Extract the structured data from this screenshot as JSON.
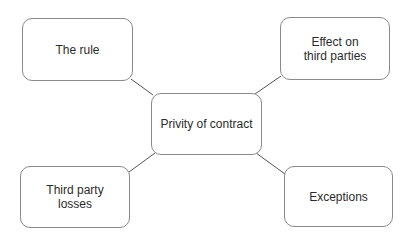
{
  "diagram": {
    "type": "mind-map",
    "center": {
      "label": "Privity of contract"
    },
    "nodes": [
      {
        "id": "rule",
        "label": "The rule"
      },
      {
        "id": "effect",
        "label": "Effect on\nthird parties"
      },
      {
        "id": "losses",
        "label": "Third party\nlosses"
      },
      {
        "id": "exceptions",
        "label": "Exceptions"
      }
    ],
    "edges": [
      {
        "from": "center",
        "to": "rule"
      },
      {
        "from": "center",
        "to": "effect"
      },
      {
        "from": "center",
        "to": "losses"
      },
      {
        "from": "center",
        "to": "exceptions"
      }
    ],
    "colors": {
      "border": "#8a8a8a",
      "line": "#555555",
      "text": "#2b2b2b",
      "background": "#ffffff"
    }
  }
}
